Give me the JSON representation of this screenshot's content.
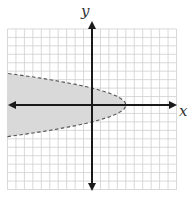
{
  "graph": {
    "x_axis_label": "x",
    "y_axis_label": "y",
    "grid": {
      "x_min": -10,
      "x_max": 10,
      "y_min": -10,
      "y_max": 9,
      "unit_px": 8.45
    },
    "inequality": "x < 4 - y^2",
    "boundary": {
      "type": "parabola",
      "style": "dashed",
      "vertex": [
        4,
        0
      ],
      "y_intercepts": [
        2,
        -2
      ],
      "opens": "left"
    },
    "shaded_region": "inside (left of) parabola",
    "colors": {
      "shade": "#d9d9d9",
      "grid": "#c8c8c8",
      "axis": "#1a1a1a",
      "boundary": "#555555"
    }
  }
}
